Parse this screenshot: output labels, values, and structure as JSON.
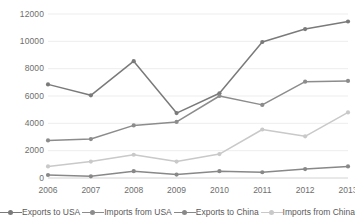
{
  "chart_data": {
    "type": "line",
    "title": "",
    "xlabel": "",
    "ylabel": "",
    "categories": [
      "2006",
      "2007",
      "2008",
      "2009",
      "2010",
      "2011",
      "2012",
      "2013"
    ],
    "ylim": [
      0,
      12000
    ],
    "y_ticks": [
      "0",
      "2000",
      "4000",
      "6000",
      "8000",
      "10000",
      "12000"
    ],
    "grid": true,
    "legend_position": "bottom",
    "markers": true,
    "series": [
      {
        "name": "Exports to USA",
        "color": "#7a7a7a",
        "values": [
          6850,
          6050,
          8550,
          4750,
          6200,
          9950,
          10900,
          11450
        ]
      },
      {
        "name": "Imports from USA",
        "color": "#8c8c8c",
        "values": [
          2750,
          2850,
          3850,
          4100,
          6000,
          5350,
          7050,
          7100
        ]
      },
      {
        "name": "Exports to China",
        "color": "#888888",
        "values": [
          220,
          120,
          500,
          250,
          500,
          420,
          650,
          850
        ]
      },
      {
        "name": "Imports from China",
        "color": "#c9c9c9",
        "values": [
          850,
          1200,
          1700,
          1200,
          1750,
          3550,
          3050,
          4800
        ]
      }
    ]
  }
}
